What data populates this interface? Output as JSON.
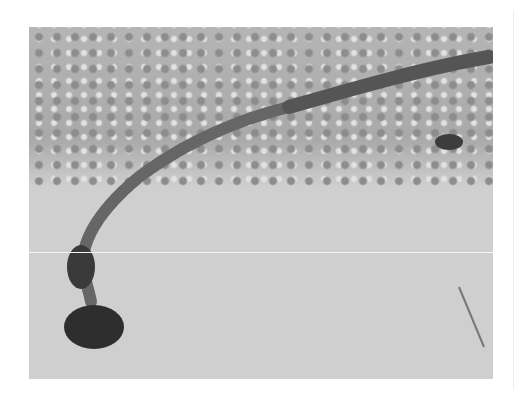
{
  "image": {
    "description": "Grayscale photograph of a procession of caterpillars crawling in a long curved line across a sandy/stone surface with a gravel patch at the top",
    "subject": "processionary caterpillars",
    "colors": {
      "background": "#ffffff",
      "ground": "#cfcfcf",
      "gravel": "#a9a9a9",
      "caterpillar": "#5a5a5a",
      "lead_caterpillar": "#2e2e2e"
    }
  }
}
